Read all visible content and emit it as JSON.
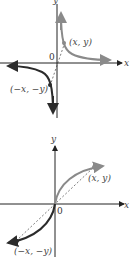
{
  "figures": [
    {
      "name": "odd-function-hyperbola",
      "axis_x_label": "x",
      "axis_y_label": "y",
      "origin_label": "0",
      "point_positive": "(x, y)",
      "point_negative": "(−x, −y)"
    },
    {
      "name": "odd-function-s-curve",
      "axis_x_label": "x",
      "axis_y_label": "y",
      "origin_label": "0",
      "point_positive": "(x, y)",
      "point_negative": "(−x, −y)"
    }
  ],
  "colors": {
    "curve_positive": "#8a8a8a",
    "curve_negative": "#2b2b2b",
    "axis": "#222222",
    "point_fill": "#8a8a8a"
  }
}
